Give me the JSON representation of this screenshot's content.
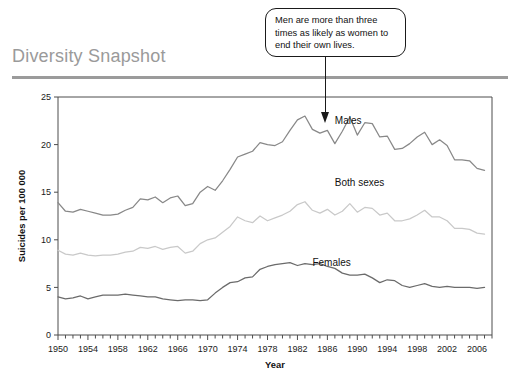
{
  "header": {
    "title": "Diversity Snapshot"
  },
  "callout": {
    "name": "annotation-callout",
    "text": "Men are more than three times as likely as women to end their own lives.",
    "points_to_year": 1986,
    "points_to_series": "Males"
  },
  "chart_data": {
    "type": "line",
    "title": "",
    "xlabel": "Year",
    "ylabel": "Suicides per 100 000",
    "xlim": [
      1950,
      2008
    ],
    "ylim": [
      0,
      25
    ],
    "yticks": [
      0,
      5,
      10,
      15,
      20,
      25
    ],
    "xticks": [
      1950,
      1954,
      1958,
      1962,
      1966,
      1970,
      1974,
      1978,
      1982,
      1986,
      1990,
      1994,
      1998,
      2002,
      2006
    ],
    "xtick_labels": [
      "1950",
      "1954",
      "1958",
      "1962",
      "1966",
      "1970",
      "1974",
      "1978",
      "1982",
      "1986",
      "1990",
      "1994",
      "1998",
      "2002",
      "2006"
    ],
    "ytick_labels": [
      "0",
      "5",
      "10",
      "15",
      "20",
      "25"
    ],
    "minor_xtick_step": 1,
    "grid": false,
    "legend_position": "inline-labels",
    "x": [
      1950,
      1951,
      1952,
      1953,
      1954,
      1955,
      1956,
      1957,
      1958,
      1959,
      1960,
      1961,
      1962,
      1963,
      1964,
      1965,
      1966,
      1967,
      1968,
      1969,
      1970,
      1971,
      1972,
      1973,
      1974,
      1975,
      1976,
      1977,
      1978,
      1979,
      1980,
      1981,
      1982,
      1983,
      1984,
      1985,
      1986,
      1987,
      1988,
      1989,
      1990,
      1991,
      1992,
      1993,
      1994,
      1995,
      1996,
      1997,
      1998,
      1999,
      2000,
      2001,
      2002,
      2003,
      2004,
      2005,
      2006,
      2007
    ],
    "series": [
      {
        "name": "Males",
        "color": "#888888",
        "label_x": 1987,
        "label_y": 22.2,
        "values": [
          13.9,
          13.0,
          12.9,
          13.2,
          13.0,
          12.8,
          12.6,
          12.6,
          12.7,
          13.1,
          13.4,
          14.3,
          14.2,
          14.5,
          13.9,
          14.4,
          14.6,
          13.6,
          13.8,
          15.0,
          15.6,
          15.2,
          16.2,
          17.4,
          18.7,
          19.0,
          19.3,
          20.2,
          20.0,
          19.9,
          20.3,
          21.5,
          22.6,
          23.0,
          21.6,
          21.2,
          21.5,
          20.1,
          21.4,
          22.9,
          21.0,
          22.3,
          22.2,
          20.8,
          20.9,
          19.5,
          19.6,
          20.1,
          20.8,
          21.3,
          20.0,
          20.5,
          19.9,
          18.4,
          18.4,
          18.3,
          17.5,
          17.3
        ]
      },
      {
        "name": "Both sexes",
        "color": "#c9c9c9",
        "label_x": 1987,
        "label_y": 15.6,
        "values": [
          8.9,
          8.5,
          8.4,
          8.6,
          8.4,
          8.3,
          8.4,
          8.4,
          8.5,
          8.7,
          8.8,
          9.2,
          9.1,
          9.3,
          9.0,
          9.2,
          9.3,
          8.6,
          8.8,
          9.6,
          10.0,
          10.2,
          10.8,
          11.4,
          12.4,
          12.0,
          11.8,
          12.5,
          12.0,
          12.3,
          12.6,
          13.0,
          13.7,
          14.0,
          13.1,
          12.8,
          13.2,
          12.6,
          13.0,
          13.8,
          12.9,
          13.4,
          13.3,
          12.6,
          12.8,
          12.0,
          12.0,
          12.2,
          12.6,
          13.1,
          12.4,
          12.4,
          12.0,
          11.2,
          11.2,
          11.1,
          10.7,
          10.6
        ]
      },
      {
        "name": "Females",
        "color": "#6b6b6b",
        "label_x": 1984,
        "label_y": 7.2,
        "values": [
          4.0,
          3.8,
          3.9,
          4.1,
          3.8,
          4.0,
          4.2,
          4.2,
          4.2,
          4.3,
          4.2,
          4.1,
          4.0,
          4.0,
          3.8,
          3.7,
          3.6,
          3.7,
          3.7,
          3.6,
          3.7,
          4.4,
          5.0,
          5.5,
          5.6,
          6.0,
          6.1,
          6.9,
          7.2,
          7.4,
          7.5,
          7.6,
          7.3,
          7.5,
          7.4,
          7.5,
          7.2,
          7.0,
          6.5,
          6.3,
          6.3,
          6.4,
          6.0,
          5.5,
          5.8,
          5.7,
          5.2,
          5.0,
          5.2,
          5.4,
          5.1,
          5.0,
          5.1,
          5.0,
          5.0,
          5.0,
          4.9,
          5.0
        ]
      }
    ]
  }
}
